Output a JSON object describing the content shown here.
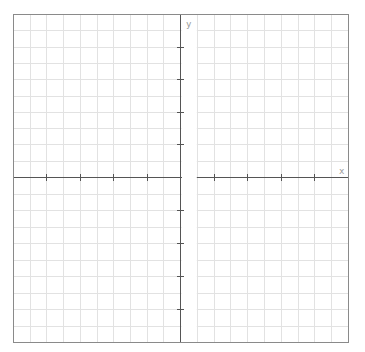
{
  "diagram": {
    "type": "coordinate-grid",
    "labels": {
      "x_axis": "x",
      "y_axis": "y"
    },
    "plot_area": {
      "left": 13,
      "top": 14,
      "right": 348,
      "bottom": 342
    },
    "origin": {
      "x": 180,
      "y": 177
    },
    "grid": {
      "cols_left": 10,
      "cols_right": 10,
      "rows_above": 10,
      "rows_below": 10,
      "tick_every_cells": 2
    },
    "colors": {
      "background": "#ffffff",
      "grid": "#e2e2e2",
      "axis": "#555555",
      "border": "#8a8a8a",
      "label": "#9a9a9a",
      "gap_band": "#ffffff"
    }
  }
}
